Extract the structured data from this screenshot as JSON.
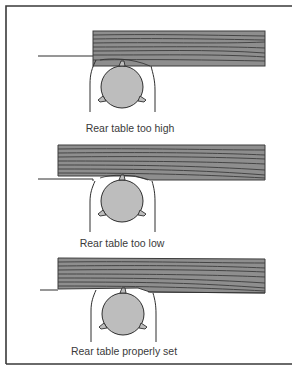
{
  "figure": {
    "colors": {
      "frame": "#3a3a3a",
      "line": "#2e2e2e",
      "board_fill": "#8e8e8e",
      "board_grain": "#3c3c3c",
      "cutter_fill": "#bdbdbd",
      "background": "#ffffff"
    },
    "panels": [
      {
        "id": "too-high",
        "caption": "Rear table too high",
        "board": {
          "x": 93,
          "y": 31,
          "w": 172,
          "h": 35
        },
        "infeed_table_y": 56,
        "cutter_center": [
          122,
          86
        ],
        "caption_pos": [
          130,
          132
        ]
      },
      {
        "id": "too-low",
        "caption": "Rear table too low",
        "board": {
          "x": 58,
          "y": 145,
          "w": 207,
          "h": 35
        },
        "infeed_table_y": 179,
        "cutter_center": [
          122,
          201
        ],
        "caption_pos": [
          122,
          247
        ]
      },
      {
        "id": "properly-set",
        "caption": "Rear table properly set",
        "board": {
          "x": 58,
          "y": 258,
          "w": 207,
          "h": 34
        },
        "infeed_table_y": 289,
        "cutter_center": [
          123,
          314
        ],
        "caption_pos": [
          124,
          355
        ]
      }
    ]
  }
}
